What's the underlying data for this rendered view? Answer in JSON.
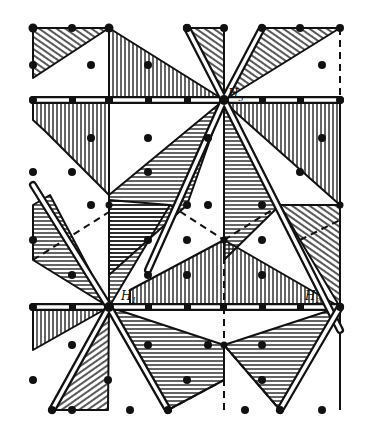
{
  "figure": {
    "title": "",
    "colors": {
      "ink": "#111111",
      "background": "#ffffff"
    },
    "labels": [
      {
        "id": "H3",
        "text": "H",
        "sub": "3",
        "x": 228,
        "y": 98
      },
      {
        "id": "H1",
        "text": "H",
        "sub": "1",
        "x": 121,
        "y": 300
      },
      {
        "id": "H2",
        "text": "H",
        "sub": "2",
        "x": 305,
        "y": 300
      }
    ],
    "centers": {
      "H3": [
        224,
        100
      ],
      "H1": [
        109,
        307
      ],
      "H2": [
        340,
        307
      ]
    },
    "lattice_dots": [
      [
        72,
        28
      ],
      [
        187,
        28
      ],
      [
        300,
        28
      ],
      [
        91,
        65
      ],
      [
        148,
        65
      ],
      [
        322,
        65
      ],
      [
        33,
        65
      ],
      [
        91,
        138
      ],
      [
        148,
        138
      ],
      [
        208,
        138
      ],
      [
        322,
        138
      ],
      [
        72,
        172
      ],
      [
        148,
        172
      ],
      [
        300,
        172
      ],
      [
        33,
        172
      ],
      [
        91,
        205
      ],
      [
        208,
        205
      ],
      [
        262,
        205
      ],
      [
        187,
        205
      ],
      [
        33,
        240
      ],
      [
        187,
        240
      ],
      [
        262,
        240
      ],
      [
        148,
        240
      ],
      [
        72,
        275
      ],
      [
        187,
        275
      ],
      [
        262,
        275
      ],
      [
        148,
        275
      ],
      [
        72,
        345
      ],
      [
        148,
        345
      ],
      [
        208,
        345
      ],
      [
        262,
        345
      ],
      [
        33,
        380
      ],
      [
        187,
        380
      ],
      [
        262,
        380
      ],
      [
        108,
        380
      ],
      [
        130,
        410
      ],
      [
        245,
        410
      ],
      [
        322,
        410
      ],
      [
        72,
        410
      ]
    ]
  }
}
